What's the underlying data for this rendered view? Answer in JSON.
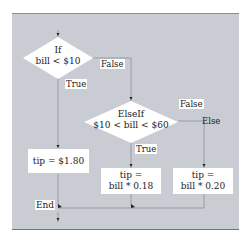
{
  "diagram": {
    "type": "flowchart",
    "background_color": "#c9ccd2",
    "nodes": {
      "if_decision": {
        "keyword": "If",
        "condition": "bill < $10"
      },
      "elseif_decision": {
        "keyword": "ElseIf",
        "condition": "$10 < bill < $60"
      },
      "tip_low": {
        "text": "tip = $1.80"
      },
      "tip_mid": {
        "line1": "tip =",
        "line2": "bill * 0.18"
      },
      "tip_high": {
        "line1": "tip =",
        "line2": "bill * 0.20"
      },
      "end": {
        "text": "End"
      }
    },
    "edge_labels": {
      "if_true": "True",
      "if_false": "False",
      "elseif_true": "True",
      "elseif_false": "False",
      "else": "Else"
    }
  }
}
